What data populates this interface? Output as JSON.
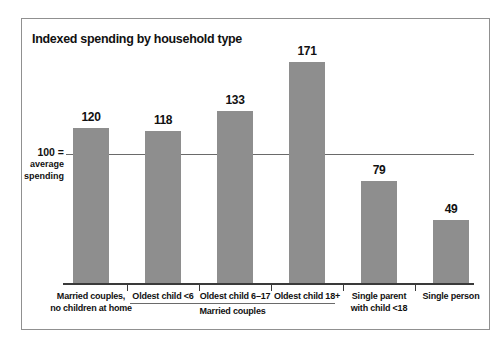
{
  "chart": {
    "title": "Indexed spending by household type"
  },
  "chart_data": {
    "type": "bar",
    "title": "Indexed spending by household type",
    "categories": [
      "Married couples, no children at home",
      "Oldest child <6",
      "Oldest child 6–17",
      "Oldest child 18+",
      "Single parent with child <18",
      "Single person"
    ],
    "category_label_lines": [
      [
        "Married couples,",
        "no children at home"
      ],
      [
        "Oldest child <6"
      ],
      [
        "Oldest child 6–17"
      ],
      [
        "Oldest child 18+"
      ],
      [
        "Single parent",
        "with child <18"
      ],
      [
        "Single person"
      ]
    ],
    "values": [
      120,
      118,
      133,
      171,
      79,
      49
    ],
    "reference_line": {
      "value": 100,
      "label": "100 = average spending",
      "label_lines": [
        "100 =",
        "average",
        "spending"
      ]
    },
    "group_bracket": {
      "label": "Married couples",
      "from_category_index": 1,
      "to_category_index": 3
    },
    "xlabel": "",
    "ylabel": "",
    "ylim": [
      0,
      190
    ],
    "grid": false,
    "legend": null,
    "colors": {
      "bar": "#8e8e8e",
      "axis": "#3a3a3a",
      "reference_line": "#6a6a6a",
      "text": "#111111",
      "frame_border": "#909090",
      "background": "#ffffff"
    }
  }
}
